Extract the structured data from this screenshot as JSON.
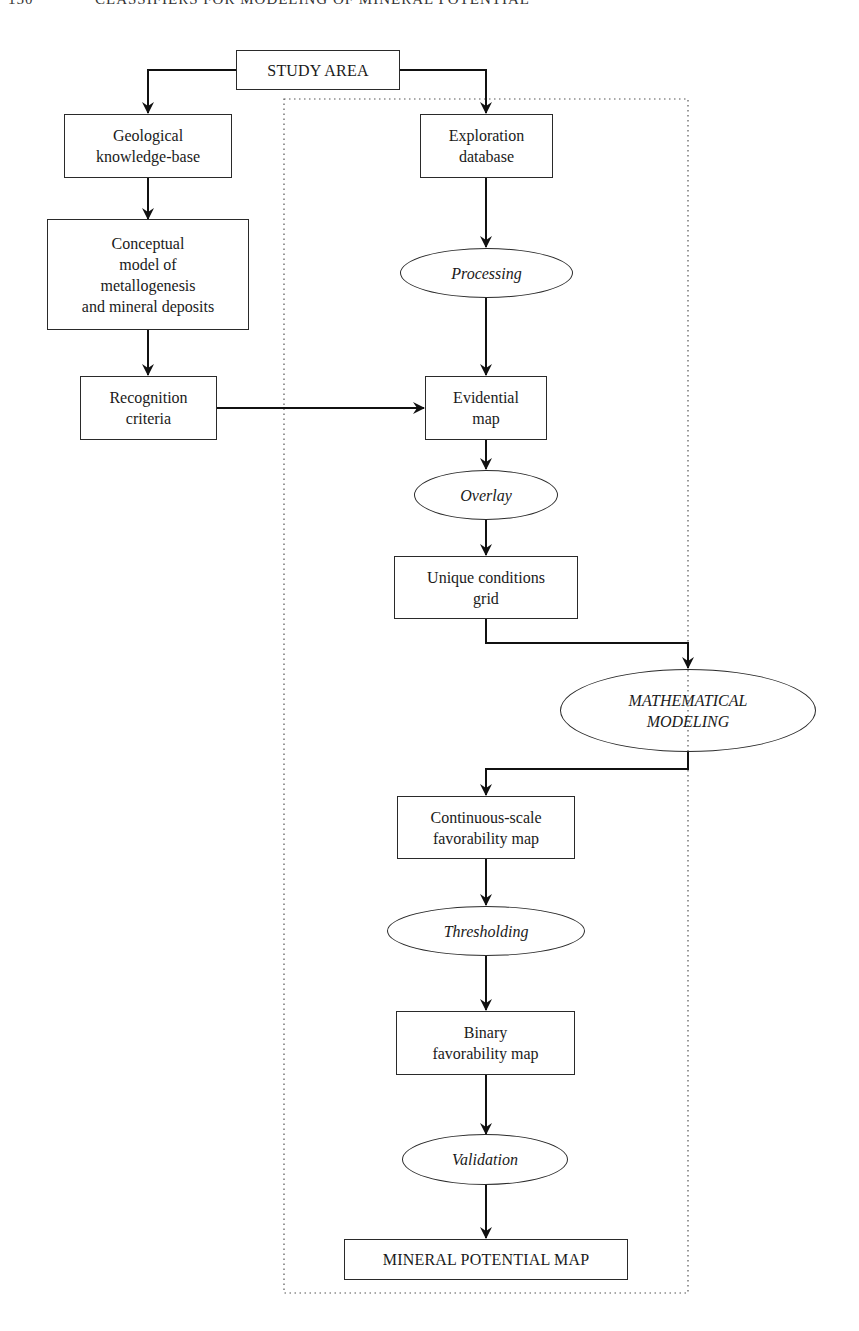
{
  "page_header": {
    "page_number": "150",
    "running_title": "CLASSIFIERS FOR MODELING OF MINERAL POTENTIAL"
  },
  "diagram": {
    "type": "flowchart",
    "nodes": {
      "study_area": {
        "label": "STUDY AREA",
        "shape": "box"
      },
      "geological_kb": {
        "label": "Geological\nknowledge-base",
        "shape": "box"
      },
      "conceptual_model": {
        "label": "Conceptual\nmodel of\nmetallogenesis\nand mineral deposits",
        "shape": "box"
      },
      "recognition_criteria": {
        "label": "Recognition\ncriteria",
        "shape": "box"
      },
      "exploration_db": {
        "label": "Exploration\ndatabase",
        "shape": "box"
      },
      "processing": {
        "label": "Processing",
        "shape": "ellipse"
      },
      "evidential_map": {
        "label": "Evidential\nmap",
        "shape": "box"
      },
      "overlay": {
        "label": "Overlay",
        "shape": "ellipse"
      },
      "unique_conditions": {
        "label": "Unique conditions\ngrid",
        "shape": "box"
      },
      "math_modeling": {
        "label": "MATHEMATICAL\nMODELING",
        "shape": "ellipse"
      },
      "continuous_map": {
        "label": "Continuous-scale\nfavorability map",
        "shape": "box"
      },
      "thresholding": {
        "label": "Thresholding",
        "shape": "ellipse"
      },
      "binary_map": {
        "label": "Binary\nfavorability map",
        "shape": "box"
      },
      "validation": {
        "label": "Validation",
        "shape": "ellipse"
      },
      "mineral_potential_map": {
        "label": "MINERAL POTENTIAL MAP",
        "shape": "box"
      }
    },
    "edges": [
      [
        "study_area",
        "geological_kb"
      ],
      [
        "study_area",
        "exploration_db"
      ],
      [
        "geological_kb",
        "conceptual_model"
      ],
      [
        "conceptual_model",
        "recognition_criteria"
      ],
      [
        "recognition_criteria",
        "evidential_map"
      ],
      [
        "exploration_db",
        "processing"
      ],
      [
        "processing",
        "evidential_map"
      ],
      [
        "evidential_map",
        "overlay"
      ],
      [
        "overlay",
        "unique_conditions"
      ],
      [
        "unique_conditions",
        "math_modeling"
      ],
      [
        "math_modeling",
        "continuous_map"
      ],
      [
        "continuous_map",
        "thresholding"
      ],
      [
        "thresholding",
        "binary_map"
      ],
      [
        "binary_map",
        "validation"
      ],
      [
        "validation",
        "mineral_potential_map"
      ]
    ],
    "dotted_region": "encloses data-driven modeling workflow (exploration database through mineral potential map)"
  }
}
